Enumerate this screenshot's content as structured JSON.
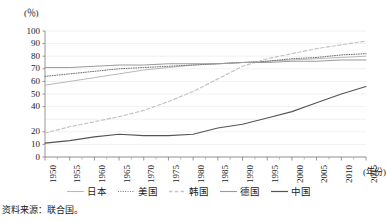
{
  "chart_data": {
    "type": "line",
    "title": "",
    "xlabel": "(年份)",
    "ylabel": "(％)",
    "unit_label": "(％)",
    "grid": true,
    "legend_position": "bottom",
    "xlim": [
      1950,
      2015
    ],
    "ylim": [
      0,
      100
    ],
    "ytick_values": [
      100,
      90,
      80,
      70,
      60,
      50,
      40,
      20,
      10,
      0
    ],
    "ytick_labels": [
      "100",
      "90",
      "80",
      "70",
      "60",
      "50",
      "40",
      "20",
      "10",
      "0"
    ],
    "x": [
      1950,
      1955,
      1960,
      1965,
      1970,
      1975,
      1980,
      1985,
      1990,
      1995,
      2000,
      2005,
      2010,
      2015
    ],
    "xtick_labels": [
      "1950",
      "1955",
      "1960",
      "1965",
      "1970",
      "1975",
      "1980",
      "1985",
      "1990",
      "1995",
      "2000",
      "2005",
      "2010",
      "2015"
    ],
    "series": [
      {
        "name": "日本",
        "color": "#b9b9b9",
        "style": "solid",
        "width": 1.0,
        "values": [
          57,
          60,
          63,
          66,
          69,
          71,
          73,
          74,
          75,
          76,
          77,
          78,
          79,
          80
        ]
      },
      {
        "name": "美国",
        "color": "#6f6f6f",
        "style": "dotted",
        "width": 1.0,
        "values": [
          64,
          66,
          68,
          70,
          71,
          72,
          73,
          74,
          75,
          76,
          78,
          79,
          81,
          82
        ]
      },
      {
        "name": "韩国",
        "color": "#c4c4c4",
        "style": "dashed",
        "width": 1.2,
        "values": [
          19,
          24,
          28,
          32,
          37,
          44,
          52,
          62,
          72,
          78,
          82,
          86,
          89,
          92
        ]
      },
      {
        "name": "德国",
        "color": "#9a9a9a",
        "style": "solid",
        "width": 1.0,
        "values": [
          71,
          71,
          72,
          73,
          73,
          74,
          74,
          74,
          75,
          75,
          76,
          76,
          77,
          77
        ]
      },
      {
        "name": "中国",
        "color": "#555555",
        "style": "solid",
        "width": 1.1,
        "values": [
          11,
          13,
          16,
          18,
          17,
          17,
          18,
          23,
          26,
          31,
          36,
          43,
          50,
          56
        ]
      }
    ]
  },
  "axis": {
    "y_unit": "(％)",
    "x_unit": "(年份)"
  },
  "legend": {
    "items": [
      {
        "label": "日本"
      },
      {
        "label": "美国"
      },
      {
        "label": "韩国"
      },
      {
        "label": "德国"
      },
      {
        "label": "中国"
      }
    ]
  },
  "footer": {
    "source": "资料来源：联合国。"
  }
}
